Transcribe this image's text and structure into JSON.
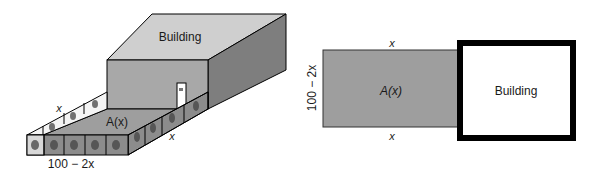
{
  "left_figure": {
    "building_label": "Building",
    "area_label": "A(x)",
    "side_label_top": "x",
    "side_label_right": "x",
    "front_label": "100 − 2x",
    "enclosure_panel_icon": "animal-icon"
  },
  "right_figure": {
    "building_label": "Building",
    "area_label": "A(x)",
    "top_label": "x",
    "bottom_label": "x",
    "left_label": "100 − 2x"
  },
  "colors": {
    "area_fill": "#9e9e9e",
    "building_front": "#a8a8a8",
    "building_top": "#cfcfcf",
    "building_side": "#7e7e7e",
    "building_outline": "#000000",
    "panel_fill": "#8c8c8c"
  }
}
